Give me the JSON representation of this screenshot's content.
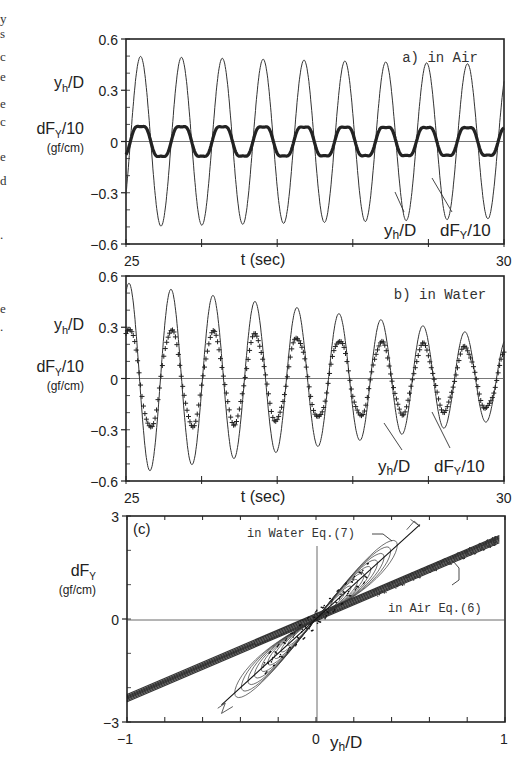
{
  "figure": {
    "left_margin_fragments": [
      "y",
      "s",
      "c",
      "e",
      "e",
      "c",
      "e",
      "d",
      ".",
      "e",
      "."
    ],
    "panels": [
      {
        "id": "a",
        "annotation": "a) in Air",
        "y_label_1_main": "y",
        "y_label_1_sub": "h",
        "y_label_1_tail": "/D",
        "y_label_2_main": "dF",
        "y_label_2_sub": "Y",
        "y_label_2_tail": "/10",
        "y_units": "(gf/cm)",
        "y_ticks": [
          "0.6",
          "0.3",
          "0",
          "−0.3",
          "−0.6"
        ],
        "x_ticks": [
          "25",
          "30"
        ],
        "x_label": "t (sec)",
        "curve_label_1": "yh/D",
        "curve_label_2": "dFY/10"
      },
      {
        "id": "b",
        "annotation": "b) in Water",
        "y_label_1_main": "y",
        "y_label_1_sub": "h",
        "y_label_1_tail": "/D",
        "y_label_2_main": "dF",
        "y_label_2_sub": "Y",
        "y_label_2_tail": "/10",
        "y_units": "(gf/cm)",
        "y_ticks": [
          "0.6",
          "0.3",
          "0",
          "−0.3",
          "−0.6"
        ],
        "x_ticks": [
          "25",
          "30"
        ],
        "x_label": "t (sec)",
        "curve_label_1": "yh/D",
        "curve_label_2": "dFY/10"
      },
      {
        "id": "c",
        "annotation": "(c)",
        "y_label_main": "dF",
        "y_label_sub": "Y",
        "y_units": "(gf/cm)",
        "y_ticks": [
          "3",
          "0",
          "−3"
        ],
        "x_ticks": [
          "−1",
          "0",
          "1"
        ],
        "x_label_main": "y",
        "x_label_sub": "h",
        "x_label_tail": "/D",
        "label_water": "in Water Eq.(7)",
        "label_air": "in Air Eq.(6)"
      }
    ]
  },
  "chart_data": [
    {
      "type": "line",
      "title": "a) in Air",
      "xlabel": "t (sec)",
      "ylabel": "yh/D, dFY/10 (gf/cm)",
      "xlim": [
        25,
        30
      ],
      "ylim": [
        -0.6,
        0.6
      ],
      "y_ticks": [
        0.6,
        0.3,
        0,
        -0.3,
        -0.6
      ],
      "grid": false,
      "series": [
        {
          "name": "yh/D",
          "style": "thin line",
          "frequency_hz": 1.85,
          "amplitude_start": 0.5,
          "amplitude_end": 0.45,
          "mean": 0.0
        },
        {
          "name": "dFY/10",
          "style": "plus markers (dense)",
          "frequency_hz": 1.85,
          "amplitude_start": 0.12,
          "amplitude_end": 0.11,
          "mean": 0.0,
          "phase": "in phase with yh/D"
        }
      ]
    },
    {
      "type": "line",
      "title": "b) in Water",
      "xlabel": "t (sec)",
      "ylabel": "yh/D, dFY/10 (gf/cm)",
      "xlim": [
        25,
        30
      ],
      "ylim": [
        -0.6,
        0.6
      ],
      "y_ticks": [
        0.6,
        0.3,
        0,
        -0.3,
        -0.6
      ],
      "grid": false,
      "series": [
        {
          "name": "yh/D",
          "style": "thin line",
          "frequency_hz": 1.8,
          "amplitude_start": 0.56,
          "amplitude_end": 0.24,
          "mean": 0.0,
          "note": "decaying"
        },
        {
          "name": "dFY/10",
          "style": "plus markers",
          "frequency_hz": 1.8,
          "amplitude_start": 0.3,
          "amplitude_end": 0.17,
          "mean": 0.0,
          "note": "decaying"
        }
      ]
    },
    {
      "type": "scatter",
      "title": "(c)",
      "xlabel": "yh/D",
      "ylabel": "dFY (gf/cm)",
      "xlim": [
        -1,
        1
      ],
      "ylim": [
        -3,
        3
      ],
      "x_ticks": [
        -1,
        0,
        1
      ],
      "y_ticks": [
        3,
        0,
        -3
      ],
      "grid": false,
      "series": [
        {
          "name": "in Water Eq.(7)",
          "approx_slope": 5.0,
          "x_range": [
            -0.52,
            0.52
          ],
          "style": "loops + line"
        },
        {
          "name": "in Air Eq.(6)",
          "approx_slope": 2.4,
          "x_range": [
            -1.0,
            1.0
          ],
          "style": "dense band"
        }
      ]
    }
  ]
}
